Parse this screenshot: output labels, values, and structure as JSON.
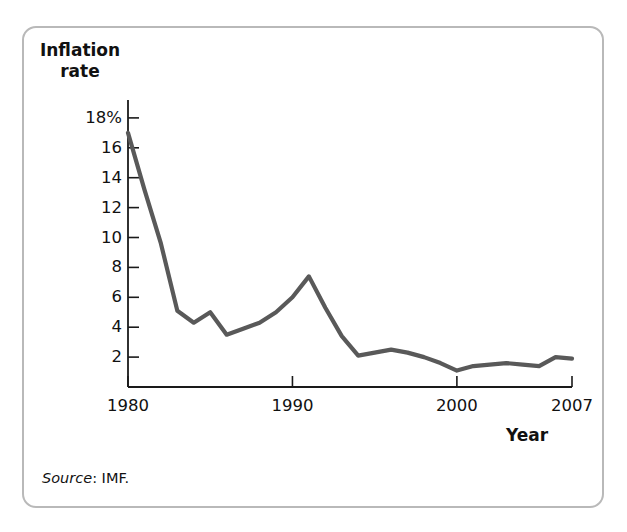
{
  "figure": {
    "top_caption": "",
    "source_prefix": "Source",
    "source_text": ": IMF."
  },
  "chart_data": {
    "type": "line",
    "title": "",
    "subtitle": "",
    "xlabel": "Year",
    "ylabel": "Inflation\nrate",
    "ylabel_line1": "Inflation",
    "ylabel_line2": "rate",
    "xlim": [
      1980,
      2007
    ],
    "ylim": [
      0,
      19
    ],
    "grid": false,
    "legend": null,
    "line_color": "#595959",
    "axis_color": "#1a1a1a",
    "y_ticks": [
      2,
      4,
      6,
      8,
      10,
      12,
      14,
      16,
      18
    ],
    "y_tick_labels": [
      "2",
      "4",
      "6",
      "8",
      "10",
      "12",
      "14",
      "16",
      "18%"
    ],
    "x_ticks": [
      1980,
      1990,
      2000,
      2007
    ],
    "x_tick_labels": [
      "1980",
      "1990",
      "2000",
      "2007"
    ],
    "x": [
      1980,
      1981,
      1982,
      1983,
      1984,
      1985,
      1986,
      1987,
      1988,
      1989,
      1990,
      1991,
      1992,
      1993,
      1994,
      1995,
      1996,
      1997,
      1998,
      1999,
      2000,
      2001,
      2002,
      2003,
      2004,
      2005,
      2006,
      2007
    ],
    "values": [
      17.0,
      13.2,
      9.6,
      5.1,
      4.3,
      5.0,
      3.5,
      3.9,
      4.3,
      5.0,
      6.0,
      7.4,
      5.3,
      3.4,
      2.1,
      2.3,
      2.5,
      2.3,
      2.0,
      1.6,
      1.1,
      1.4,
      1.5,
      1.6,
      1.5,
      1.4,
      2.0,
      1.9
    ],
    "series": [
      {
        "name": "Inflation rate",
        "values": [
          17.0,
          13.2,
          9.6,
          5.1,
          4.3,
          5.0,
          3.5,
          3.9,
          4.3,
          5.0,
          6.0,
          7.4,
          5.3,
          3.4,
          2.1,
          2.3,
          2.5,
          2.3,
          2.0,
          1.6,
          1.1,
          1.4,
          1.5,
          1.6,
          1.5,
          1.4,
          2.0,
          1.9
        ]
      }
    ]
  }
}
